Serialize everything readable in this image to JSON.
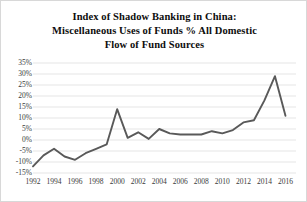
{
  "chart_data": {
    "type": "line",
    "title": "Index of Shadow Banking in China: Miscellaneous Uses of Funds % All Domestic Flow of Fund Sources",
    "title_lines": [
      "Index of Shadow Banking in China:",
      "Miscellaneous Uses of Funds % All Domestic",
      "Flow of Fund Sources"
    ],
    "xlabel": "",
    "ylabel": "",
    "ylim": [
      -15,
      35
    ],
    "xlim": [
      1992,
      2017
    ],
    "ytick_step": 5,
    "ytick_labels": [
      "35%",
      "30%",
      "25%",
      "20%",
      "15%",
      "10%",
      "5%",
      "0%",
      "-5%",
      "-10%",
      "-15%"
    ],
    "ytick_values": [
      35,
      30,
      25,
      20,
      15,
      10,
      5,
      0,
      -5,
      -10,
      -15
    ],
    "xtick_labels": [
      "1992",
      "1994",
      "1996",
      "1998",
      "2000",
      "2002",
      "2004",
      "2006",
      "2008",
      "2010",
      "2012",
      "2014",
      "2016"
    ],
    "xtick_values": [
      1992,
      1994,
      1996,
      1998,
      2000,
      2002,
      2004,
      2006,
      2008,
      2010,
      2012,
      2014,
      2016
    ],
    "grid": true,
    "grid_color": "#dedede",
    "legend": false,
    "legend_position": "none",
    "line_color": "#595959",
    "line_width": 1.9,
    "x": [
      1992,
      1993,
      1994,
      1995,
      1996,
      1997,
      1998,
      1999,
      2000,
      2001,
      2002,
      2003,
      2004,
      2005,
      2006,
      2007,
      2008,
      2009,
      2010,
      2011,
      2012,
      2013,
      2014,
      2015,
      2016
    ],
    "values": [
      -12.0,
      -7.0,
      -4.0,
      -7.5,
      -9.0,
      -6.0,
      -4.0,
      -2.0,
      14.0,
      1.0,
      3.5,
      0.5,
      5.0,
      3.0,
      2.5,
      2.5,
      2.5,
      4.0,
      3.0,
      4.5,
      8.0,
      9.0,
      18.0,
      29.0,
      11.0
    ],
    "series": [
      {
        "name": "Miscellaneous Uses of Funds % All Domestic Flow of Fund Sources",
        "values": [
          -12.0,
          -7.0,
          -4.0,
          -7.5,
          -9.0,
          -6.0,
          -4.0,
          -2.0,
          14.0,
          1.0,
          3.5,
          0.5,
          5.0,
          3.0,
          2.5,
          2.5,
          2.5,
          4.0,
          3.0,
          4.5,
          8.0,
          9.0,
          18.0,
          29.0,
          11.0
        ]
      }
    ]
  }
}
